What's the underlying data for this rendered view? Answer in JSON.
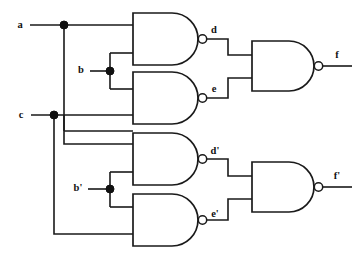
{
  "diagram": {
    "type": "logic-circuit-schematic",
    "gate_type": "NAND",
    "colors": {
      "line": "#1a1a1a",
      "background": "#ffffff",
      "junction": "#111111"
    }
  },
  "inputs": [
    {
      "id": "a",
      "label": "a",
      "x": 20,
      "y": 26
    },
    {
      "id": "b",
      "label": "b",
      "x": 81,
      "y": 71
    },
    {
      "id": "c",
      "label": "c",
      "x": 21,
      "y": 116
    },
    {
      "id": "bp",
      "label": "b'",
      "x": 78,
      "y": 189
    }
  ],
  "outputs": [
    {
      "id": "f",
      "label": "f",
      "x": 337,
      "y": 63
    },
    {
      "id": "fp",
      "label": "f'",
      "x": 337,
      "y": 184
    }
  ],
  "internal_signals": [
    {
      "id": "d",
      "label": "d",
      "x": 214,
      "y": 31
    },
    {
      "id": "e",
      "label": "e",
      "x": 214,
      "y": 90
    },
    {
      "id": "dp",
      "label": "d'",
      "x": 214,
      "y": 152
    },
    {
      "id": "ep",
      "label": "e'",
      "x": 214,
      "y": 215
    }
  ],
  "gates": [
    {
      "id": "g1",
      "name": "nand-gate-1",
      "inputs": [
        "a",
        "b"
      ],
      "output": "d"
    },
    {
      "id": "g2",
      "name": "nand-gate-2",
      "inputs": [
        "b",
        "c"
      ],
      "output": "e"
    },
    {
      "id": "g3",
      "name": "nand-gate-3",
      "inputs": [
        "c",
        "b'"
      ],
      "output": "d'"
    },
    {
      "id": "g4",
      "name": "nand-gate-4",
      "inputs": [
        "b'",
        "c"
      ],
      "output": "e'"
    },
    {
      "id": "g5",
      "name": "nand-gate-5",
      "inputs": [
        "d",
        "e"
      ],
      "output": "f"
    },
    {
      "id": "g6",
      "name": "nand-gate-6",
      "inputs": [
        "d'",
        "e'"
      ],
      "output": "f'"
    }
  ],
  "junctions": [
    {
      "id": "j-a",
      "name": "junction-a",
      "x": 64,
      "y": 25
    },
    {
      "id": "j-b",
      "name": "junction-b",
      "x": 110,
      "y": 71
    },
    {
      "id": "j-c",
      "name": "junction-c",
      "x": 54,
      "y": 115
    },
    {
      "id": "j-bp",
      "name": "junction-b-prime",
      "x": 110,
      "y": 189
    }
  ]
}
